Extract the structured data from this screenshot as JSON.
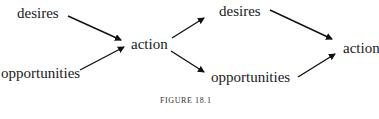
{
  "diagram": {
    "left": {
      "desires": "desires",
      "opportunities": "opportunities",
      "action": "action"
    },
    "right": {
      "desires": "desires",
      "opportunities": "opportunities",
      "action": "action"
    },
    "edges": [
      {
        "from": "left.desires",
        "to": "left.action"
      },
      {
        "from": "left.opportunities",
        "to": "left.action"
      },
      {
        "from": "left.action",
        "to": "right.desires"
      },
      {
        "from": "left.action",
        "to": "right.opportunities"
      },
      {
        "from": "right.desires",
        "to": "right.action"
      },
      {
        "from": "right.opportunities",
        "to": "right.action"
      }
    ],
    "caption": "FIGURE 18.1"
  }
}
